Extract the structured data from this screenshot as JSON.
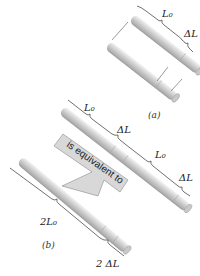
{
  "figure": {
    "panel_a": {
      "caption": "(a)",
      "length_label": "L₀",
      "delta_label": "ΔL",
      "rod_count": 2
    },
    "panel_b": {
      "caption": "(b)",
      "segment_labels": [
        "L₀",
        "ΔL",
        "L₀",
        "ΔL"
      ],
      "combined_length_label": "2L₀",
      "combined_delta_label": "2 ΔL"
    },
    "arrow": {
      "text": "is equivalent to"
    },
    "colors": {
      "rod_light": "#e4e4e4",
      "rod_mid": "#c4c4c4",
      "rod_dark": "#9a9a9a",
      "arrow_fill": "#d8d8d8",
      "line": "#333333"
    }
  }
}
